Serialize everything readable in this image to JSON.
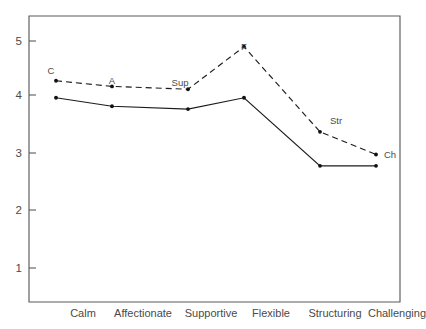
{
  "chart_data": {
    "type": "line",
    "title": "",
    "subtitle": "",
    "xlabel": "",
    "ylabel": "",
    "categories": [
      "Calm",
      "Affectionate",
      "Supportive",
      "Flexible",
      "Structuring",
      "Challenging"
    ],
    "ylim": [
      0.55,
      5.6
    ],
    "yticks": [
      1,
      2,
      3,
      4,
      5
    ],
    "ytick_labels": [
      "1",
      "2",
      "3",
      "4",
      "5"
    ],
    "grid": false,
    "legend_position": "none",
    "series": [
      {
        "name": "solid-series",
        "style": "solid",
        "marker": "dot",
        "values": [
          4.0,
          3.85,
          3.8,
          4.0,
          2.8,
          2.8
        ],
        "point_labels": [
          "",
          "",
          "",
          "",
          "",
          ""
        ]
      },
      {
        "name": "dashed-series",
        "style": "dashed",
        "marker": "dot",
        "values": [
          4.3,
          4.2,
          4.15,
          4.9,
          3.4,
          3.0
        ],
        "point_labels": [
          "C",
          "A",
          "Sup",
          "F",
          "Str",
          "Ch"
        ]
      }
    ],
    "annotations": [
      {
        "text": "C",
        "series": "dashed-series",
        "category": "Calm",
        "placement": "above-left"
      },
      {
        "text": "A",
        "series": "dashed-series",
        "category": "Affectionate",
        "placement": "above"
      },
      {
        "text": "Sup",
        "series": "dashed-series",
        "category": "Supportive",
        "placement": "above-left"
      },
      {
        "text": "F",
        "series": "dashed-series",
        "category": "Flexible",
        "placement": "above"
      },
      {
        "text": "Str",
        "series": "dashed-series",
        "category": "Structuring",
        "placement": "above-right"
      },
      {
        "text": "Ch",
        "series": "dashed-series",
        "category": "Challenging",
        "placement": "above-right"
      }
    ],
    "colors": {
      "axis": "#5a5a5a",
      "series_solid": "#1c1c1c",
      "series_dashed": "#1c1c1c",
      "text": "#4a4a4a",
      "background": "#ffffff"
    }
  },
  "axis": {
    "ytick_1": "1",
    "ytick_2": "2",
    "ytick_3": "3",
    "ytick_4": "4",
    "ytick_5": "5",
    "cat_0": "Calm",
    "cat_1": "Affectionate",
    "cat_2": "Supportive",
    "cat_3": "Flexible",
    "cat_4": "Structuring",
    "cat_5": "Challenging"
  },
  "labels": {
    "p0": "C",
    "p1": "A",
    "p2": "Sup",
    "p3": "F",
    "p4": "Str",
    "p5": "Ch"
  }
}
